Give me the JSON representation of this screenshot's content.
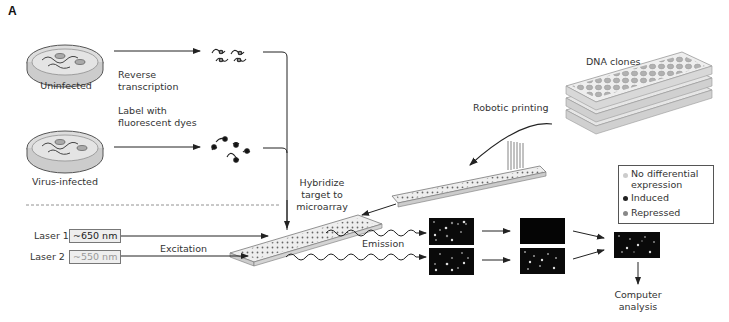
{
  "panel_label": "A",
  "samples": {
    "uninfected": "Uninfected",
    "virus_infected": "Virus-infected"
  },
  "steps": {
    "reverse_transcription": [
      "Reverse",
      "transcription"
    ],
    "label_dyes": [
      "Label with",
      "fluorescent dyes"
    ],
    "hybridize": [
      "Hybridize",
      "target to",
      "microarray"
    ],
    "robotic_printing": "Robotic printing",
    "dna_clones": "DNA clones",
    "excitation": "Excitation",
    "emission": "Emission",
    "computer_analysis": [
      "Computer",
      "analysis"
    ]
  },
  "lasers": [
    {
      "label": "Laser 1",
      "wavelength": "~650 nm"
    },
    {
      "label": "Laser 2",
      "wavelength": "~550 nm"
    }
  ],
  "legend": {
    "items": [
      {
        "label": [
          "No differential",
          "expression"
        ],
        "color": "#cccccc"
      },
      {
        "label": [
          "Induced"
        ],
        "color": "#222222"
      },
      {
        "label": [
          "Repressed"
        ],
        "color": "#888888"
      }
    ]
  },
  "colors": {
    "line": "#333333",
    "scan_bg": "#0a0a0a",
    "slide": "#e8e8e8"
  }
}
